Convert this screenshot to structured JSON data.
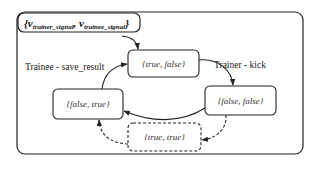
{
  "diagram": {
    "type": "state-machine",
    "variables_label": {
      "open_brace": "{",
      "var1_main": "v",
      "var1_sub": "trainer_signal",
      "separator": ", ",
      "var2_main": "v",
      "var2_sub": "trainee_signal",
      "close_brace": "}"
    },
    "states": [
      {
        "id": "s_true_false",
        "label": "{true, false}",
        "style": "solid"
      },
      {
        "id": "s_false_false",
        "label": "{false, false}",
        "style": "solid"
      },
      {
        "id": "s_false_true",
        "label": "{false, true}",
        "style": "solid"
      },
      {
        "id": "s_true_true",
        "label": "{true, true}",
        "style": "dashed"
      }
    ],
    "transitions": [
      {
        "from": "initial",
        "to": "s_true_false",
        "label": "",
        "style": "solid"
      },
      {
        "from": "s_true_false",
        "to": "s_false_false",
        "label": "Trainer - kick",
        "style": "solid"
      },
      {
        "from": "s_false_false",
        "to": "s_false_true",
        "label": "",
        "style": "solid"
      },
      {
        "from": "s_false_true",
        "to": "s_true_false",
        "label": "Trainee - save_result",
        "style": "solid"
      },
      {
        "from": "s_false_false",
        "to": "s_true_true",
        "label": "",
        "style": "dashed"
      },
      {
        "from": "s_true_true",
        "to": "s_false_true",
        "label": "",
        "style": "dashed"
      }
    ],
    "colors": {
      "stroke": "#222222",
      "text": "#333333",
      "background": "#ffffff"
    }
  }
}
